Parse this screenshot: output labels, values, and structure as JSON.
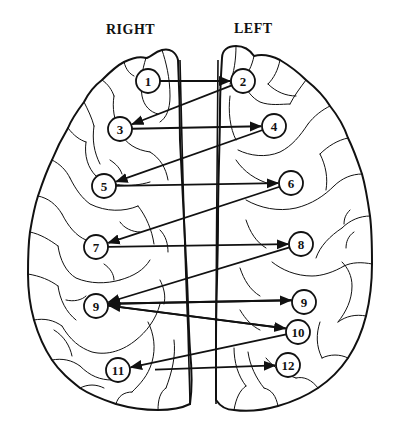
{
  "diagram": {
    "labels": {
      "right": "RIGHT",
      "left": "LEFT"
    },
    "nodes": [
      {
        "id": "n1",
        "label": "1",
        "side": "right",
        "x": 148,
        "y": 81
      },
      {
        "id": "n2",
        "label": "2",
        "side": "left",
        "x": 243,
        "y": 81
      },
      {
        "id": "n3",
        "label": "3",
        "side": "right",
        "x": 120,
        "y": 129
      },
      {
        "id": "n4",
        "label": "4",
        "side": "left",
        "x": 274,
        "y": 126
      },
      {
        "id": "n5",
        "label": "5",
        "side": "right",
        "x": 104,
        "y": 186
      },
      {
        "id": "n6",
        "label": "6",
        "side": "left",
        "x": 291,
        "y": 183
      },
      {
        "id": "n7",
        "label": "7",
        "side": "right",
        "x": 96,
        "y": 247
      },
      {
        "id": "n8",
        "label": "8",
        "side": "left",
        "x": 301,
        "y": 244
      },
      {
        "id": "n9r",
        "label": "9",
        "side": "right",
        "x": 96,
        "y": 306
      },
      {
        "id": "n9l",
        "label": "9",
        "side": "left",
        "x": 304,
        "y": 302
      },
      {
        "id": "n10",
        "label": "10",
        "side": "left",
        "x": 298,
        "y": 332
      },
      {
        "id": "n11",
        "label": "11",
        "side": "right",
        "x": 118,
        "y": 370
      },
      {
        "id": "n12",
        "label": "12",
        "side": "left",
        "x": 288,
        "y": 365
      }
    ],
    "edges": [
      {
        "from": "n1",
        "to": "n2"
      },
      {
        "from": "n2",
        "to": "n3"
      },
      {
        "from": "n3",
        "to": "n4"
      },
      {
        "from": "n4",
        "to": "n5"
      },
      {
        "from": "n5",
        "to": "n6"
      },
      {
        "from": "n6",
        "to": "n7"
      },
      {
        "from": "n7",
        "to": "n8"
      },
      {
        "from": "n8",
        "to": "n9r"
      },
      {
        "from": "n9r",
        "to": "n9l",
        "offset": -2
      },
      {
        "from": "n9l",
        "to": "n9r",
        "offset": 2
      },
      {
        "from": "n9r",
        "to": "n10",
        "offset": -2
      },
      {
        "from": "n10",
        "to": "n9r",
        "offset": 2
      },
      {
        "from": "n10",
        "to": "n11"
      },
      {
        "from": "n11",
        "to": "n12",
        "startX": 155
      }
    ],
    "node_radius": 12,
    "colors": {
      "ink": "#111111",
      "background": "#ffffff"
    }
  }
}
